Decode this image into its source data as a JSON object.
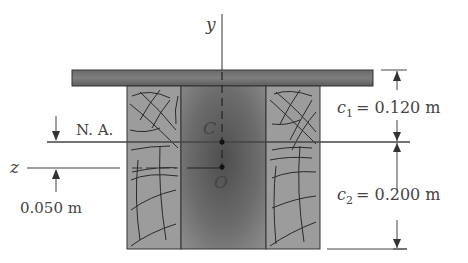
{
  "figure": {
    "axes": {
      "y_label": "y",
      "z_label": "z"
    },
    "points": {
      "centroid_label": "C",
      "origin_label": "O"
    },
    "neutral_axis_label": "N. A.",
    "dimensions": {
      "c1_symbol": "c",
      "c1_sub": "1",
      "c1_value": "= 0.120 m",
      "c2_symbol": "c",
      "c2_sub": "2",
      "c2_value": "= 0.200 m",
      "offset_value": "0.050 m"
    },
    "colors": {
      "steel_dark": "#5a5a5a",
      "steel_mid": "#7a7a7a",
      "wood": "#9a9a9a",
      "line": "#444444",
      "grain": "#2a2a2a"
    }
  }
}
